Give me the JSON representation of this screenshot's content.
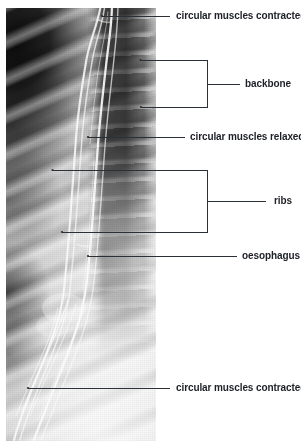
{
  "figure": {
    "kind": "annotated-radiograph",
    "width": 301,
    "height": 441,
    "background_color": "#ffffff",
    "line_color": "#2b2f36",
    "text_color": "#1d2026"
  },
  "image": {
    "name": "xray-radiograph",
    "alt": "black and white X-ray showing ribs, backbone and a barium-filled oesophagus"
  },
  "labels": {
    "muscles_contracted_top": "circular muscles contracted",
    "backbone": "backbone",
    "muscles_relaxed": "circular muscles relaxed",
    "ribs": "ribs",
    "oesophagus": "oesophagus",
    "muscles_contracted_bottom": "circular muscles contracted"
  },
  "annotations": [
    {
      "id": "muscles-contracted-top",
      "label": "circular muscles contracted",
      "style": "leader",
      "target_x": 102,
      "target_y": 16,
      "text_x": 176,
      "text_y": 16
    },
    {
      "id": "backbone",
      "label": "backbone",
      "style": "bracket",
      "bracket_left": 140,
      "bracket_right": 207,
      "bracket_top": 60,
      "bracket_bottom": 107,
      "target_top_x": 140,
      "target_top_y": 60,
      "target_bottom_x": 141,
      "target_bottom_y": 107,
      "text_x": 245,
      "text_y": 84
    },
    {
      "id": "muscles-relaxed",
      "label": "circular muscles relaxed",
      "style": "leader",
      "target_x": 88,
      "target_y": 137,
      "text_x": 190,
      "text_y": 137
    },
    {
      "id": "ribs",
      "label": "ribs",
      "style": "bracket",
      "bracket_left": 52,
      "bracket_right": 207,
      "bracket_top": 170,
      "bracket_bottom": 232,
      "target_top_x": 52,
      "target_top_y": 170,
      "target_bottom_x": 62,
      "target_bottom_y": 232,
      "text_x": 274,
      "text_y": 201
    },
    {
      "id": "oesophagus",
      "label": "oesophagus",
      "style": "leader",
      "target_x": 88,
      "target_y": 256,
      "text_x": 242,
      "text_y": 256
    },
    {
      "id": "muscles-contracted-bottom",
      "label": "circular muscles contracted",
      "style": "leader",
      "target_x": 28,
      "target_y": 388,
      "text_x": 176,
      "text_y": 388
    }
  ]
}
